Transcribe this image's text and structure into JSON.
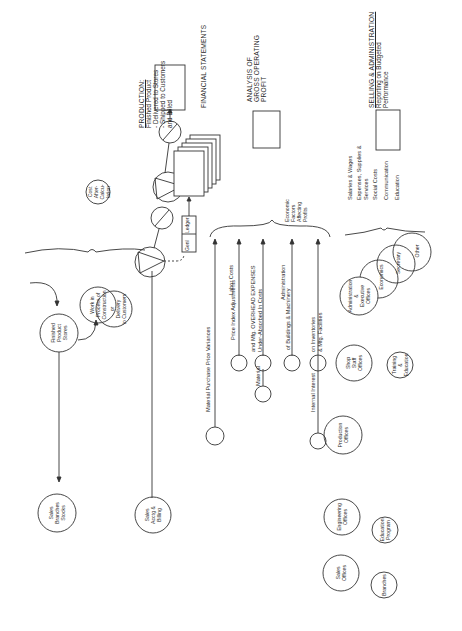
{
  "diagram": {
    "sections": {
      "production": {
        "title": "PRODUCTION:",
        "lines": [
          "Finished Product",
          "- Delivered to Stores",
          "- Shipped to Customers",
          "  and Billed"
        ]
      },
      "financial": {
        "title": "FINANCIAL STATEMENTS"
      },
      "gross_profit": {
        "lines": [
          "ANALYSIS OF",
          "GROSS OPERATING",
          "PROFIT"
        ]
      },
      "selling_admin": {
        "title": "SELLING & ADMINISTRATION",
        "lines": [
          "Reporting on Budgeted",
          "Performance"
        ]
      }
    },
    "ledger": {
      "left": "Genl",
      "right": "Ledger"
    },
    "economic_factors": [
      "Economic",
      "Factors",
      "Affecting",
      "Profits"
    ],
    "flows": {
      "material_variances": "Material Purchase Price Variances",
      "labor_costs": "Labor Costs",
      "price_index": "Price Index Adjustments",
      "overhead_1": "and Mfg. OVERHEAD EXPENSES",
      "overhead_2": "Under-Absorbed In Costs",
      "material": "Material",
      "administration": "Administration",
      "buildings": "of Buildings & Machinery",
      "internal_interest": "Internal Interest",
      "inventories_1": "on Inventories",
      "inventories_2": "& Mfg. Facilities"
    },
    "expense_list": [
      "Salaries & Wages",
      "Expenses, Supplies &",
      "Services",
      "Social Costs",
      "Communication",
      "Education"
    ],
    "circles": {
      "cost_after": [
        "Cost",
        "After-",
        "Calcu-",
        "lation"
      ],
      "work_in_process": [
        "Work in",
        "Process of",
        "Construction"
      ],
      "delivery": [
        "or",
        "Delivery",
        "to Customers"
      ],
      "finished_stores": [
        "Finished",
        "Product",
        "Stores"
      ],
      "sales_branches_stocks": [
        "Sales",
        "Branches",
        "Stocks"
      ],
      "sales_acctg_billing": [
        "Sales",
        "Acctg &",
        "Billing"
      ],
      "admin_exec": [
        "Administration",
        "&",
        "Executive",
        "Offices"
      ],
      "economics": [
        "Economics"
      ],
      "secretary": [
        "Secretary"
      ],
      "other": [
        "Other"
      ],
      "shop_staff": [
        "Shop",
        "Staff",
        "Offices"
      ],
      "training": [
        "Training",
        "&",
        "Education"
      ],
      "production_offices": [
        "Production",
        "Offices"
      ],
      "engineering_offices": [
        "Engineering",
        "Offices"
      ],
      "education_program": [
        "Education",
        "Program"
      ],
      "sales_offices": [
        "Sales",
        "Offices"
      ],
      "branches": [
        "Branches"
      ]
    }
  }
}
